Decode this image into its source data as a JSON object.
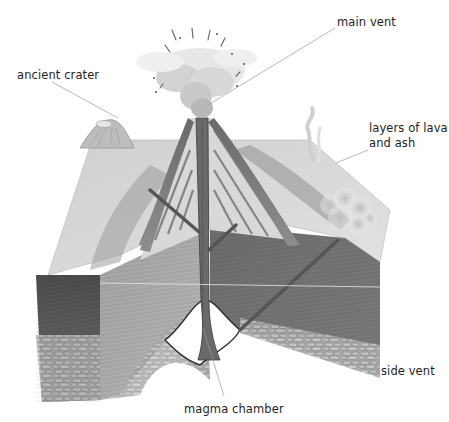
{
  "diagram": {
    "labels": [
      {
        "id": "main-vent",
        "lines": [
          "main vent"
        ],
        "x": 337,
        "y": 15
      },
      {
        "id": "ancient-crater",
        "lines": [
          "ancient crater"
        ],
        "x": 17,
        "y": 68
      },
      {
        "id": "layers-of-lava-and-ash",
        "lines": [
          "layers of lava",
          "and ash"
        ],
        "x": 369,
        "y": 121
      },
      {
        "id": "side-vent",
        "lines": [
          "side vent"
        ],
        "x": 381,
        "y": 364
      },
      {
        "id": "magma-chamber",
        "lines": [
          "magma chamber"
        ],
        "x": 184,
        "y": 402
      }
    ],
    "colors": {
      "background": "#ffffff",
      "text": "#1e1e1e",
      "leader_line": "#9a9a9a",
      "strata_dark": "#5a5a5a",
      "strata_mid": "#8a8a8a",
      "strata_light": "#c4c4c4",
      "ground": "#d6d6d6",
      "smoke": "#e4e4e4"
    }
  }
}
